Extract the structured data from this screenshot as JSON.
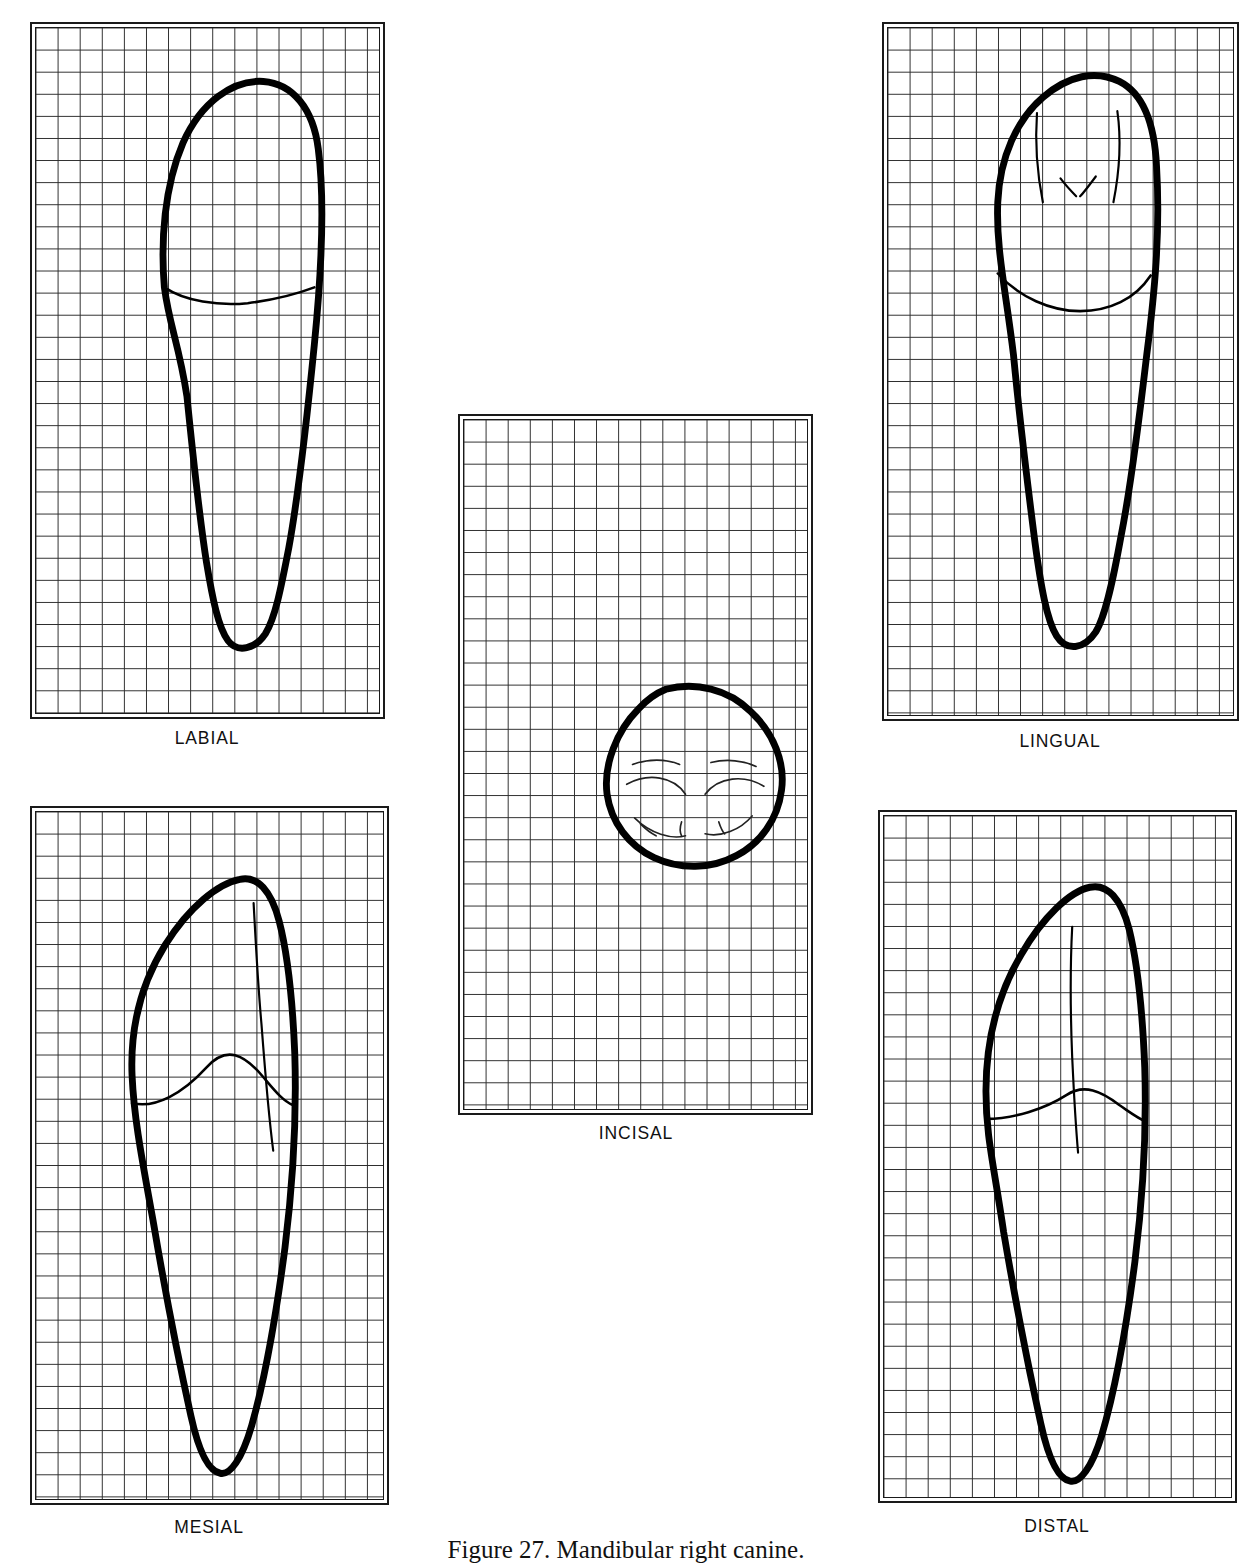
{
  "figure": {
    "caption": "Figure 27.  Mandibular right canine.",
    "background_color": "#ffffff",
    "ink_color": "#000000",
    "grid_color": "#2a2a2a",
    "grid_square_px": 22
  },
  "panels": [
    {
      "id": "labial",
      "label": "LABIAL",
      "left": 30,
      "top": 22,
      "width": 355,
      "height": 697,
      "cols": 16,
      "rows": 31,
      "label_center_x": 207,
      "label_top": 728
    },
    {
      "id": "lingual",
      "label": "LINGUAL",
      "left": 882,
      "top": 22,
      "width": 357,
      "height": 699,
      "cols": 16,
      "rows": 31,
      "label_center_x": 1060,
      "label_top": 731
    },
    {
      "id": "incisal",
      "label": "INCISAL",
      "left": 458,
      "top": 414,
      "width": 355,
      "height": 701,
      "cols": 16,
      "rows": 31,
      "label_center_x": 636,
      "label_top": 1123
    },
    {
      "id": "mesial",
      "label": "MESIAL",
      "left": 30,
      "top": 806,
      "width": 359,
      "height": 699,
      "cols": 16,
      "rows": 31,
      "label_center_x": 209,
      "label_top": 1517
    },
    {
      "id": "distal",
      "label": "DISTAL",
      "left": 878,
      "top": 810,
      "width": 359,
      "height": 693,
      "cols": 16,
      "rows": 31,
      "label_center_x": 1057,
      "label_top": 1516
    }
  ],
  "drawings": {
    "labial": {
      "crown_and_root_outline": "M 131 262 C 127 215 131 160 150 116 C 168 76 200 52 232 54 C 262 56 283 82 288 122 C 296 182 290 260 284 320 C 276 400 268 470 258 525 C 250 566 244 596 234 612 C 224 627 206 632 196 619 C 186 606 180 576 174 540 C 166 490 160 430 154 372 C 146 320 136 300 131 262 Z",
      "cervical_line": "M 131 262 C 152 276 186 281 216 278 C 240 275 260 271 284 262"
    },
    "lingual": {
      "crown_and_root_outline": "M 112 176 C 114 130 132 92 158 70 C 184 48 212 42 236 54 C 260 66 272 96 274 140 C 278 206 272 268 264 330 C 256 398 248 462 238 512 C 230 556 222 594 212 610 C 200 628 182 630 172 614 C 162 598 156 564 150 520 C 142 458 134 392 128 330 C 120 264 110 222 112 176 Z",
      "cervical_line": "M 112 248 C 134 272 166 286 196 286 C 226 286 252 274 268 250",
      "marginal_ridge_mesial": "M 152 86 C 150 114 152 146 158 176",
      "marginal_ridge_distal": "M 234 84 C 238 112 236 146 230 176",
      "cingulum_ridge_1": "M 176 152 C 182 160 188 166 192 170",
      "cingulum_ridge_2": "M 212 150 C 206 158 200 166 196 170"
    },
    "incisal": {
      "crown_outline": "M 176 22 C 206 14 240 22 262 44 C 286 66 298 96 294 124 C 290 154 272 178 248 190 C 222 204 190 204 164 192 C 138 180 120 156 116 128 C 112 98 126 64 148 42 C 156 33 166 26 176 22 Z",
      "mesial_ridge": "M 142 98 C 158 92 176 92 190 98",
      "distal_ridge": "M 222 96 C 238 92 256 94 268 100",
      "fossa_mesial": "M 136 118 C 158 106 184 110 196 128",
      "fossa_distal": "M 216 128 C 230 110 256 108 276 120",
      "cingulum_lower_m": "M 144 152 C 160 168 182 174 196 170",
      "cingulum_lower_d": "M 216 168 C 232 172 252 164 264 150",
      "tick_1": "M 150 158 C 156 164 162 168 166 170",
      "tick_2": "M 192 156 C 190 162 190 166 192 170",
      "tick_3": "M 230 156 C 232 162 234 166 236 168"
    },
    "mesial": {
      "crown_and_root_outline": "M 98 266 C 96 218 108 172 132 134 C 156 96 186 72 208 68 C 226 64 240 80 248 110 C 258 148 262 196 264 244 C 266 306 262 376 254 440 C 244 516 232 578 220 620 C 210 654 198 670 188 668 C 176 666 166 646 158 610 C 146 556 132 486 120 416 C 108 350 100 310 98 266 Z",
      "inner_incisal_ridge": "M 222 92 C 224 128 226 170 230 214 C 234 266 238 312 242 342",
      "cervical_line": "M 98 294 C 122 300 150 284 174 258 C 194 236 212 244 232 268 C 244 282 252 292 262 296"
    },
    "distal": {
      "crown_and_root_outline": "M 104 278 C 104 228 116 180 140 140 C 162 102 190 76 210 72 C 228 68 242 84 250 114 C 260 154 264 204 266 254 C 268 316 264 386 256 450 C 246 526 234 586 222 626 C 212 658 200 674 190 672 C 178 670 168 650 160 614 C 148 560 134 490 122 420 C 112 352 104 324 104 278 Z",
      "inner_ridge": "M 192 112 C 190 150 190 196 192 244 C 194 286 196 318 198 340",
      "cervical_line": "M 104 306 C 132 306 164 296 186 282 C 204 270 222 278 240 292 C 252 300 260 306 266 308"
    }
  }
}
